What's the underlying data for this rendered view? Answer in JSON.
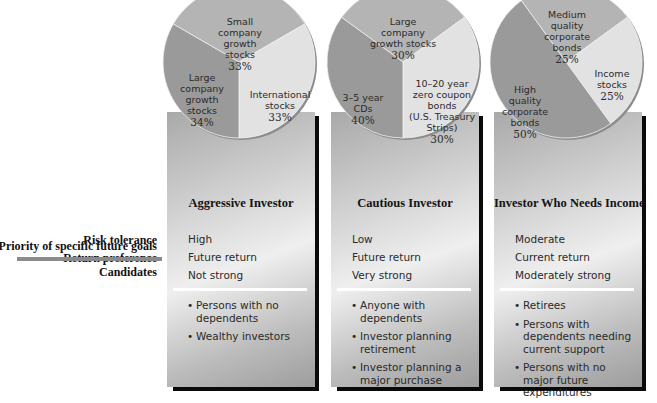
{
  "row_labels": {
    "risk": "Risk tolerance",
    "return": "Return preference",
    "priority": "Priority of specific future goals",
    "candidates": "Candidates"
  },
  "colors": {
    "slice_dark": "#9a9a9a",
    "slice_mid": "#b4b4b4",
    "slice_light": "#e2e2e2",
    "pie_rim": "#8c8c8c",
    "shadow": "#0a0a0a",
    "divider": "#ffffff",
    "left_bar": "#8a8a8a"
  },
  "panels": [
    {
      "title": "Aggressive Investor",
      "risk": "High",
      "return": "Future return",
      "priority": "Not strong",
      "candidates": [
        {
          "bullet": "•",
          "text": "Persons with no dependents"
        },
        {
          "bullet": "•",
          "text": "Wealthy investors"
        }
      ],
      "pie": [
        {
          "label": "Small\ncompany\ngrowth\nstocks",
          "pct": "33%"
        },
        {
          "label": "International\nstocks",
          "pct": "33%"
        },
        {
          "label": "Large\ncompany\ngrowth\nstocks",
          "pct": "34%"
        }
      ]
    },
    {
      "title": "Cautious Investor",
      "risk": "Low",
      "return": "Future return",
      "priority": "Very strong",
      "candidates": [
        {
          "bullet": "•",
          "text": "Anyone with dependents"
        },
        {
          "bullet": "•",
          "text": "Investor planning retirement"
        },
        {
          "bullet": "•",
          "text": "Investor planning a major purchase"
        }
      ],
      "pie": [
        {
          "label": "Large\ncompany\ngrowth stocks",
          "pct": "30%"
        },
        {
          "label": "10–20 year\nzero coupon\nbonds\n(U.S. Treasury\nStrips)",
          "pct": "30%"
        },
        {
          "label": "3–5 year\nCDs",
          "pct": "40%"
        }
      ]
    },
    {
      "title": "Investor Who Needs Income",
      "risk": "Moderate",
      "return": "Current return",
      "priority": "Moderately strong",
      "candidates": [
        {
          "bullet": "•",
          "text": "Retirees"
        },
        {
          "bullet": "•",
          "text": "Persons with dependents needing current support"
        },
        {
          "bullet": "•",
          "text": "Persons with no major future expenditures"
        }
      ],
      "pie": [
        {
          "label": "Medium\nquality\ncorporate\nbonds",
          "pct": "25%"
        },
        {
          "label": "Income\nstocks",
          "pct": "25%"
        },
        {
          "label": "High\nquality\ncorporate\nbonds",
          "pct": "50%"
        }
      ]
    }
  ]
}
